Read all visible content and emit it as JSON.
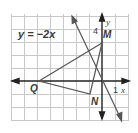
{
  "figure": {
    "equation_label": "y = −2x",
    "axis_labels": {
      "x": "x",
      "y": "y"
    },
    "tick_labels": {
      "x_one": "1",
      "y_four": "4"
    },
    "points": {
      "M": {
        "label": "M",
        "coords": [
          0,
          3
        ]
      },
      "N": {
        "label": "N",
        "coords": [
          -1,
          -1
        ]
      },
      "Q": {
        "label": "Q",
        "coords": [
          -5,
          0
        ]
      }
    },
    "line": {
      "equation": "y = -2x",
      "slope": -2,
      "intercept": 0
    },
    "colors": {
      "grid": "#c8c8c8",
      "axes": "#222222",
      "lines": "#555555",
      "background": "#ffffff"
    }
  }
}
